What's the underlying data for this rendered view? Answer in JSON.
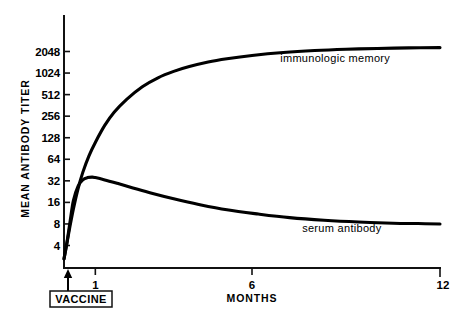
{
  "figure": {
    "background_color": "#ffffff",
    "ink_color": "#000000"
  },
  "chart_data": {
    "type": "line",
    "title": "",
    "subtitle": "",
    "xlabel": "MONTHS",
    "ylabel": "MEAN ANTIBODY TITER",
    "xlim": [
      0,
      12
    ],
    "ylim": [
      2,
      3000
    ],
    "yscale": "log2",
    "grid": false,
    "legend_position": "inline-annotation",
    "x_ticks": [
      1,
      6,
      12
    ],
    "x_tick_labels": [
      "1",
      "6",
      "12"
    ],
    "y_ticks": [
      4,
      8,
      16,
      32,
      64,
      128,
      256,
      512,
      1024,
      2048
    ],
    "y_tick_labels": [
      "4",
      "8",
      "16",
      "32",
      "64",
      "128",
      "256",
      "512",
      "1024",
      "2048"
    ],
    "series": [
      {
        "name": "immunologic memory",
        "label": "immunologic memory",
        "label_x": 6.9,
        "label_y": 1450,
        "x": [
          0.0,
          0.08,
          0.18,
          0.3,
          0.45,
          0.6,
          0.8,
          1.0,
          1.3,
          1.6,
          2.0,
          2.5,
          3.0,
          3.5,
          4.0,
          4.6,
          5.2,
          6.0,
          7.0,
          8.0,
          9.0,
          10.0,
          11.0,
          12.0
        ],
        "y": [
          2.6,
          4.0,
          7.0,
          13.0,
          25.0,
          42.0,
          72.0,
          110.0,
          190.0,
          290.0,
          440.0,
          660.0,
          880.0,
          1080.0,
          1260.0,
          1460.0,
          1620.0,
          1800.0,
          1980.0,
          2110.0,
          2200.0,
          2260.0,
          2300.0,
          2320.0
        ]
      },
      {
        "name": "serum antibody",
        "label": "serum antibody",
        "label_x": 7.6,
        "label_y": 6.2,
        "x": [
          0.0,
          0.1,
          0.2,
          0.3,
          0.45,
          0.6,
          0.75,
          0.9,
          1.0,
          1.3,
          1.7,
          2.2,
          2.8,
          3.5,
          4.3,
          5.2,
          6.2,
          7.2,
          8.3,
          9.4,
          10.5,
          11.3,
          12.0
        ],
        "y": [
          2.6,
          4.6,
          9.0,
          17.0,
          27.0,
          33.0,
          35.5,
          36.0,
          35.5,
          33.0,
          29.5,
          25.5,
          21.5,
          18.0,
          15.0,
          12.6,
          11.0,
          9.8,
          9.0,
          8.5,
          8.2,
          8.1,
          8.0
        ]
      }
    ],
    "annotations": [
      {
        "name": "vaccine-callout",
        "label": "VACCINE",
        "target_x": 0,
        "target_y": 2.6,
        "style": "boxed-arrow"
      }
    ]
  }
}
